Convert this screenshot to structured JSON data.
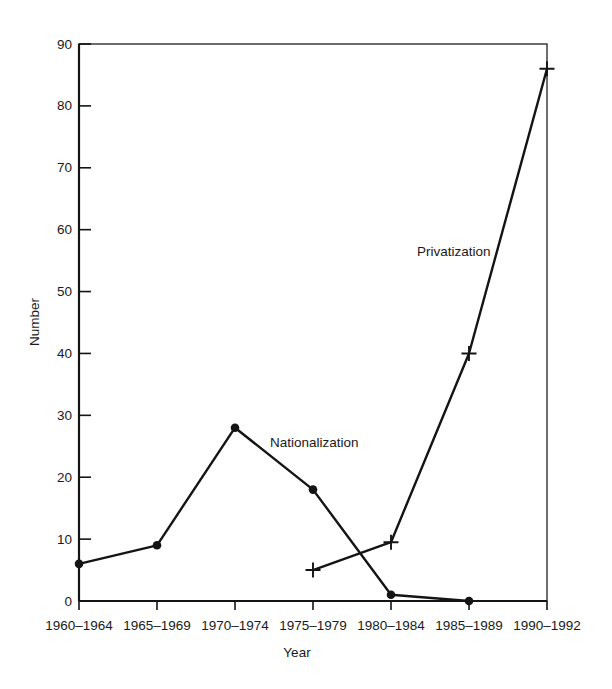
{
  "chart_data": {
    "type": "line",
    "title": "",
    "xlabel": "Year",
    "ylabel": "Number",
    "ylim": [
      0,
      90
    ],
    "yticks": [
      0,
      10,
      20,
      30,
      40,
      50,
      60,
      70,
      80,
      90
    ],
    "grid": false,
    "legend": "inline-labels",
    "categories": [
      "1960–1964",
      "1965–1969",
      "1970–1974",
      "1975–1979",
      "1980–1984",
      "1985–1989",
      "1990–1992"
    ],
    "series": [
      {
        "name": "Nationalization",
        "marker": "circle",
        "values": [
          6,
          9,
          28,
          18,
          1,
          0,
          null
        ]
      },
      {
        "name": "Privatization",
        "marker": "plus",
        "values": [
          null,
          null,
          null,
          5,
          9.5,
          40,
          86
        ]
      }
    ],
    "colors": {
      "line": "#141414",
      "frame": "#2f2f2f",
      "text": "#1a1a1a",
      "background": "#ffffff"
    }
  }
}
